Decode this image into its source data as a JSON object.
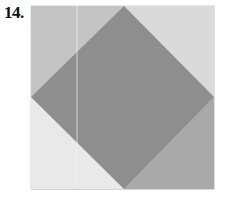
{
  "problem": {
    "number_label": "14."
  },
  "figure": {
    "square": {
      "x": 31,
      "y": 6,
      "width": 183,
      "height": 183
    },
    "diamond": {
      "top": [
        124,
        6
      ],
      "right": [
        214,
        97
      ],
      "bottom": [
        124,
        189
      ],
      "left": [
        31,
        97
      ]
    },
    "colors": {
      "diamond": "#8e8e8e",
      "corner_top_left": "#c4c4c4",
      "corner_top_right": "#dadada",
      "corner_bottom_left": "#e9e9e9",
      "corner_bottom_right": "#a9a9a9",
      "square_border": "#d8d8d8",
      "crease_line": "#f2f2f2"
    },
    "crease_line_x": 77
  }
}
